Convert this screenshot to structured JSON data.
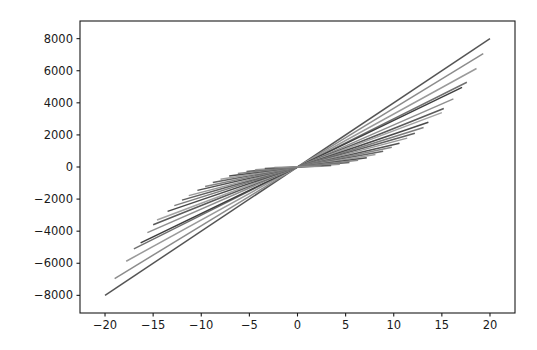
{
  "figure": {
    "background_color": "#ffffff",
    "axes_color": "#1a1a1a",
    "plot_area": {
      "left": 80,
      "top": 21,
      "right": 515,
      "bottom": 313
    }
  },
  "chart_data": {
    "type": "line",
    "title": "",
    "xlabel": "",
    "ylabel": "",
    "xlim": [
      -22.6,
      22.6
    ],
    "ylim": [
      -9100,
      9100
    ],
    "xticks": [
      -20,
      -15,
      -10,
      -5,
      0,
      5,
      10,
      15,
      20
    ],
    "xtick_labels": [
      "−20",
      "−15",
      "−10",
      "−5",
      "0",
      "5",
      "10",
      "15",
      "20"
    ],
    "yticks": [
      8000,
      6000,
      4000,
      2000,
      0,
      -2000,
      -4000,
      -6000,
      -8000
    ],
    "ytick_labels": [
      "8000",
      "6000",
      "4000",
      "2000",
      "0",
      "−2000",
      "−4000",
      "−6000",
      "−8000"
    ],
    "grid": false,
    "legend": null,
    "series": [
      {
        "name": "line-01",
        "slope": 400.0,
        "x": [
          -20.0,
          20.0
        ],
        "values": [
          -8000,
          8000
        ],
        "color": "#555555"
      },
      {
        "name": "line-02",
        "slope": 366.0,
        "x": [
          -19.0,
          19.3
        ],
        "values": [
          -6954,
          7064
        ],
        "color": "#8c8c8c"
      },
      {
        "name": "line-03",
        "slope": 330.0,
        "x": [
          -17.8,
          18.6
        ],
        "values": [
          -5874,
          6138
        ],
        "color": "#9a9a9a"
      },
      {
        "name": "line-04",
        "slope": 300.0,
        "x": [
          -17.0,
          17.6
        ],
        "values": [
          -5100,
          5280
        ],
        "color": "#6f6f6f"
      },
      {
        "name": "line-05",
        "slope": 290.0,
        "x": [
          -16.3,
          17.1
        ],
        "values": [
          -4727,
          4959
        ],
        "color": "#3f3f3f"
      },
      {
        "name": "line-06",
        "slope": 262.0,
        "x": [
          -15.6,
          16.2
        ],
        "values": [
          -4087,
          4244
        ],
        "color": "#8f8f8f"
      },
      {
        "name": "line-07",
        "slope": 240.0,
        "x": [
          -15.0,
          15.2
        ],
        "values": [
          -3600,
          3648
        ],
        "color": "#5a5a5a"
      },
      {
        "name": "line-08",
        "slope": 226.0,
        "x": [
          -14.6,
          15.0
        ],
        "values": [
          -3300,
          3390
        ],
        "color": "#a3a3a3"
      },
      {
        "name": "line-09",
        "slope": 205.0,
        "x": [
          -13.5,
          13.6
        ],
        "values": [
          -2768,
          2788
        ],
        "color": "#4a4a4a"
      },
      {
        "name": "line-10",
        "slope": 188.0,
        "x": [
          -12.8,
          13.1
        ],
        "values": [
          -2406,
          2463
        ],
        "color": "#7d7d7d"
      },
      {
        "name": "line-11",
        "slope": 172.0,
        "x": [
          -12.0,
          12.2
        ],
        "values": [
          -2064,
          2098
        ],
        "color": "#606060"
      },
      {
        "name": "line-12",
        "slope": 158.0,
        "x": [
          -11.3,
          11.4
        ],
        "values": [
          -1785,
          1801
        ],
        "color": "#999999"
      },
      {
        "name": "line-13",
        "slope": 140.0,
        "x": [
          -10.4,
          10.6
        ],
        "values": [
          -1456,
          1484
        ],
        "color": "#525252"
      },
      {
        "name": "line-14",
        "slope": 126.0,
        "x": [
          -9.6,
          9.8
        ],
        "values": [
          -1210,
          1235
        ],
        "color": "#868686"
      },
      {
        "name": "line-15",
        "slope": 110.0,
        "x": [
          -8.8,
          8.9
        ],
        "values": [
          -968,
          979
        ],
        "color": "#646464"
      },
      {
        "name": "line-16",
        "slope": 96.0,
        "x": [
          -8.0,
          8.1
        ],
        "values": [
          -768,
          778
        ],
        "color": "#9e9e9e"
      },
      {
        "name": "line-17",
        "slope": 80.0,
        "x": [
          -7.1,
          7.2
        ],
        "values": [
          -568,
          576
        ],
        "color": "#4f4f4f"
      },
      {
        "name": "line-18",
        "slope": 66.0,
        "x": [
          -6.2,
          6.3
        ],
        "values": [
          -409,
          416
        ],
        "color": "#8a8a8a"
      },
      {
        "name": "line-19",
        "slope": 52.0,
        "x": [
          -5.3,
          5.4
        ],
        "values": [
          -276,
          281
        ],
        "color": "#6a6a6a"
      },
      {
        "name": "line-20",
        "slope": 38.0,
        "x": [
          -4.4,
          4.4
        ],
        "values": [
          -167,
          167
        ],
        "color": "#959595"
      },
      {
        "name": "line-21",
        "slope": 26.0,
        "x": [
          -3.4,
          3.5
        ],
        "values": [
          -88,
          91
        ],
        "color": "#5e5e5e"
      },
      {
        "name": "line-22",
        "slope": 16.0,
        "x": [
          -2.4,
          2.5
        ],
        "values": [
          -38,
          40
        ],
        "color": "#8e8e8e"
      }
    ]
  }
}
